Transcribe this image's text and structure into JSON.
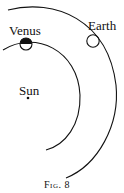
{
  "figure": {
    "caption": "Fig. 8",
    "labels": {
      "venus": "Venus",
      "earth": "Earth",
      "sun": "Sun"
    },
    "colors": {
      "ink": "#111111",
      "background": "#ffffff"
    }
  }
}
